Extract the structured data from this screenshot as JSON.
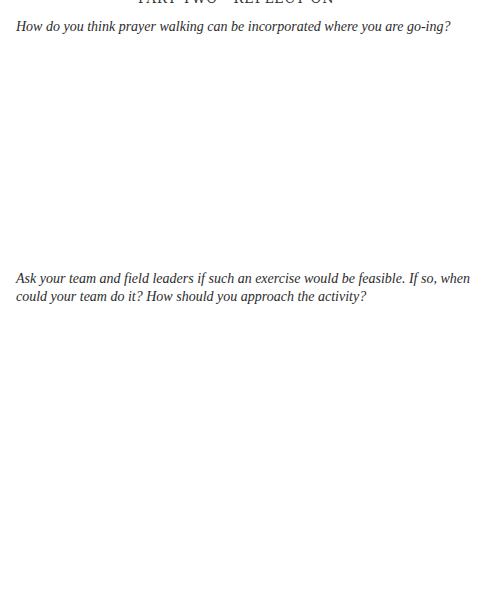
{
  "page": {
    "cutoff_header_text": "PART TWO · REFLECT ON IT",
    "questions": [
      {
        "text": "How do you think prayer walking can be incorporated where you are go-ing?"
      },
      {
        "text": "Ask your team and field leaders if such an exercise would be feasible. If so, when could your team do it? How should you approach the activity?"
      }
    ]
  }
}
